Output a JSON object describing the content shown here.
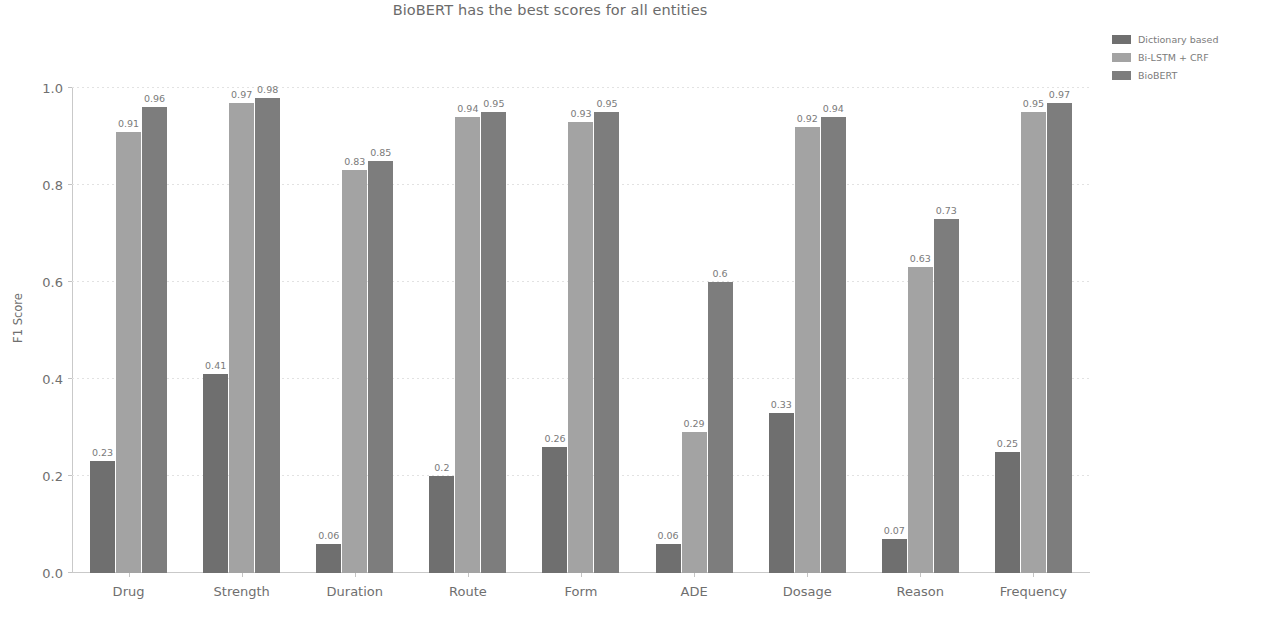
{
  "chart_data": {
    "type": "bar",
    "title": "BioBERT has the best scores for all entities",
    "xlabel": "",
    "ylabel": "F1 Score",
    "ylim": [
      0.0,
      1.0
    ],
    "yticks": [
      "0.0",
      "0.2",
      "0.4",
      "0.6",
      "0.8",
      "1.0"
    ],
    "ytick_values": [
      0.0,
      0.2,
      0.4,
      0.6,
      0.8,
      1.0
    ],
    "grid": true,
    "legend_position": "upper right outside",
    "categories": [
      "Drug",
      "Strength",
      "Duration",
      "Route",
      "Form",
      "ADE",
      "Dosage",
      "Reason",
      "Frequency"
    ],
    "series": [
      {
        "name": "Dictionary based",
        "color": "#6f6f6f",
        "values": [
          0.23,
          0.41,
          0.06,
          0.2,
          0.26,
          0.06,
          0.33,
          0.07,
          0.25
        ],
        "labels": [
          "0.23",
          "0.41",
          "0.06",
          "0.2",
          "0.26",
          "0.06",
          "0.33",
          "0.07",
          "0.25"
        ]
      },
      {
        "name": "Bi-LSTM + CRF",
        "color": "#a3a3a3",
        "values": [
          0.91,
          0.97,
          0.83,
          0.94,
          0.93,
          0.29,
          0.92,
          0.63,
          0.95
        ],
        "labels": [
          "0.91",
          "0.97",
          "0.83",
          "0.94",
          "0.93",
          "0.29",
          "0.92",
          "0.63",
          "0.95"
        ]
      },
      {
        "name": "BioBERT",
        "color": "#7d7d7d",
        "values": [
          0.96,
          0.98,
          0.85,
          0.95,
          0.95,
          0.6,
          0.94,
          0.73,
          0.97
        ],
        "labels": [
          "0.96",
          "0.98",
          "0.85",
          "0.95",
          "0.95",
          "0.6",
          "0.94",
          "0.73",
          "0.97"
        ]
      }
    ]
  }
}
